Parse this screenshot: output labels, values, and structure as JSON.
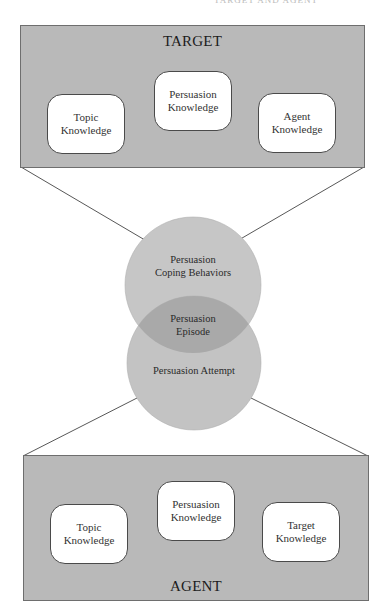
{
  "running_head": "TARGET AND AGENT",
  "colors": {
    "panel_fill": "#b9b9b9",
    "panel_border": "#6e6e6e",
    "circle_fill": "#c4c4c4",
    "overlap_fill": "#a9a9a9",
    "box_fill": "#ffffff",
    "line_color": "#444444"
  },
  "target_panel": {
    "title": "TARGET",
    "boxes": [
      {
        "line1": "Topic",
        "line2": "Knowledge"
      },
      {
        "line1": "Persuasion",
        "line2": "Knowledge"
      },
      {
        "line1": "Agent",
        "line2": "Knowledge"
      }
    ]
  },
  "center": {
    "top_circle": {
      "line1": "Persuasion",
      "line2": "Coping Behaviors"
    },
    "overlap": {
      "line1": "Persuasion",
      "line2": "Episode"
    },
    "bottom_circle": {
      "label": "Persuasion Attempt"
    }
  },
  "agent_panel": {
    "title": "AGENT",
    "boxes": [
      {
        "line1": "Topic",
        "line2": "Knowledge"
      },
      {
        "line1": "Persuasion",
        "line2": "Knowledge"
      },
      {
        "line1": "Target",
        "line2": "Knowledge"
      }
    ]
  }
}
